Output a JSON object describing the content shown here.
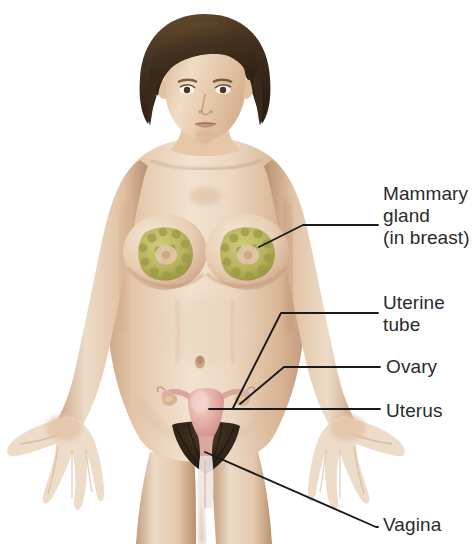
{
  "figure": {
    "background_color": "#ffffff",
    "width": 474,
    "height": 544
  },
  "labels": [
    {
      "id": "mammary",
      "text": "Mammary\ngland\n(in breast)",
      "lines": [
        "Mammary",
        "gland",
        "(in breast)"
      ]
    },
    {
      "id": "uterine_tube",
      "text": "Uterine\ntube",
      "lines": [
        "Uterine",
        "tube"
      ]
    },
    {
      "id": "ovary",
      "text": "Ovary",
      "lines": [
        "Ovary"
      ]
    },
    {
      "id": "uterus",
      "text": "Uterus",
      "lines": [
        "Uterus"
      ]
    },
    {
      "id": "vagina",
      "text": "Vagina",
      "lines": [
        "Vagina"
      ]
    }
  ],
  "label_style": {
    "text_color": "#2b2b2b",
    "font_size_px": 19,
    "leader_line_color": "#1a1a1a"
  },
  "anatomy_colors": {
    "skin_light": "#efddc9",
    "skin_mid": "#e2c3a7",
    "skin_shadow": "#c9a383",
    "skin_deep_shadow": "#b08a6c",
    "hair_dark": "#3a2a1b",
    "hair_mid": "#5b4228",
    "mammary_gland": "#b7b45a",
    "mammary_gland_dark": "#8f8c3c",
    "uterus_pink": "#e0a79f",
    "uterus_pink_light": "#edc3bb",
    "ovary_tan": "#d8b48e",
    "pubic_hair": "#2e241a",
    "outline": "#7d6450"
  },
  "structures": [
    {
      "name": "mammary-gland",
      "label": "Mammary gland (in breast)"
    },
    {
      "name": "uterine-tube",
      "label": "Uterine tube"
    },
    {
      "name": "ovary",
      "label": "Ovary"
    },
    {
      "name": "uterus",
      "label": "Uterus"
    },
    {
      "name": "vagina",
      "label": "Vagina"
    }
  ]
}
